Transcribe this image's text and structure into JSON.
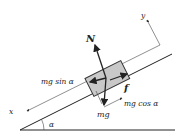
{
  "diagram": {
    "labels": {
      "normal": "N",
      "friction": "f",
      "weight": "mg",
      "sin_component": "mg sin α",
      "cos_component": "mg cos α",
      "axis_x": "x",
      "axis_y": "y",
      "angle": "α"
    },
    "colors": {
      "line": "#222222",
      "block_fill": "#c8c8c8",
      "block_stroke": "#333333"
    }
  }
}
